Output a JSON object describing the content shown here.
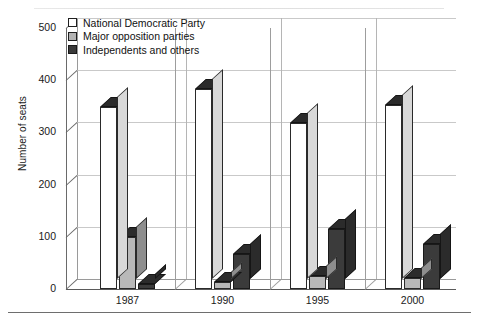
{
  "chart_data": {
    "type": "bar",
    "title": "",
    "xlabel": "",
    "ylabel": "Number of seats",
    "categories": [
      "1987",
      "1990",
      "1995",
      "2000"
    ],
    "ylim": [
      0,
      500
    ],
    "yticks": [
      0,
      100,
      200,
      300,
      400,
      500
    ],
    "grid": true,
    "legend_position": "top-left",
    "style": "3d-clustered-column",
    "series": [
      {
        "name": "National Democratic Party",
        "color": "#ffffff",
        "values": [
          348,
          383,
          318,
          353
        ]
      },
      {
        "name": "Major opposition parties",
        "color": "#b9b9b9",
        "values": [
          100,
          13,
          25,
          22
        ]
      },
      {
        "name": "Independents and others",
        "color": "#3b3b3b",
        "values": [
          10,
          68,
          115,
          87
        ]
      }
    ]
  },
  "axis": {
    "y_label": "Number of seats",
    "y_tick_labels": [
      "500",
      "400",
      "300",
      "200",
      "100",
      "0"
    ],
    "x_tick_labels": [
      "1987",
      "1990",
      "1995",
      "2000"
    ]
  },
  "legend": {
    "items": [
      {
        "label": "National Democratic Party",
        "swatch": "white"
      },
      {
        "label": "Major opposition parties",
        "swatch": "gray"
      },
      {
        "label": "Independents and others",
        "swatch": "dark"
      }
    ]
  }
}
